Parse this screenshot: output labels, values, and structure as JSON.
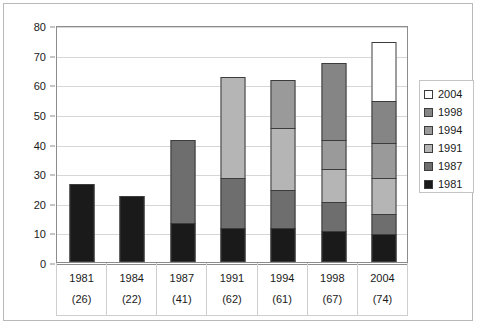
{
  "chart_data": {
    "type": "bar",
    "title": "",
    "subtitle": "",
    "xlabel": "",
    "ylabel": "",
    "stacked": true,
    "grid": true,
    "legend_position": "right",
    "ylim": [
      0,
      80
    ],
    "yticks": [
      0,
      10,
      20,
      30,
      40,
      50,
      60,
      70,
      80
    ],
    "ytick_labels": [
      "0",
      "10",
      "20",
      "30",
      "40",
      "50",
      "60",
      "70",
      "80"
    ],
    "categories": [
      "1981",
      "1984",
      "1987",
      "1991",
      "1994",
      "1998",
      "2004"
    ],
    "category_totals": [
      26,
      22,
      41,
      62,
      61,
      67,
      74
    ],
    "category_total_labels": [
      "(26)",
      "(22)",
      "(41)",
      "(62)",
      "(61)",
      "(67)",
      "(74)"
    ],
    "series": [
      {
        "name": "1981",
        "color": "#1a1a1a",
        "values": [
          26,
          22,
          13,
          11,
          11,
          10,
          9
        ]
      },
      {
        "name": "1987",
        "color": "#6e6e6e",
        "values": [
          0,
          0,
          28,
          17,
          13,
          10,
          7
        ]
      },
      {
        "name": "1991",
        "color": "#b5b5b5",
        "values": [
          0,
          0,
          0,
          34,
          21,
          11,
          12
        ]
      },
      {
        "name": "1994",
        "color": "#9a9a9a",
        "values": [
          0,
          0,
          0,
          0,
          16,
          10,
          12
        ]
      },
      {
        "name": "1998",
        "color": "#858585",
        "values": [
          0,
          0,
          0,
          0,
          0,
          26,
          14
        ]
      },
      {
        "name": "2004",
        "color": "#ffffff",
        "values": [
          0,
          0,
          0,
          0,
          0,
          0,
          20
        ]
      }
    ],
    "legend": [
      {
        "label": "2004",
        "color": "#ffffff"
      },
      {
        "label": "1998",
        "color": "#858585"
      },
      {
        "label": "1994",
        "color": "#9a9a9a"
      },
      {
        "label": "1991",
        "color": "#b5b5b5"
      },
      {
        "label": "1987",
        "color": "#6e6e6e"
      },
      {
        "label": "1981",
        "color": "#1a1a1a"
      }
    ]
  },
  "colors": {
    "plot_border": "#8c8c8c",
    "gridline": "#d6d6d6",
    "frame_border": "#b9b9b9",
    "bar_outline": "#3c3c3c",
    "background": "#ffffff",
    "text": "#1a1a1a"
  }
}
